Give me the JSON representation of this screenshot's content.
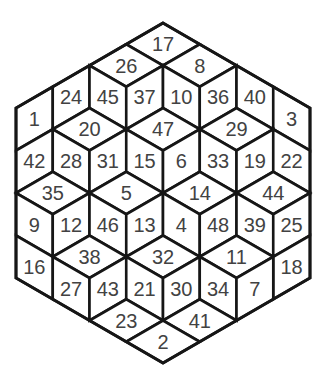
{
  "figure": {
    "kind": "hexagonal-rhombus-number-puzzle",
    "colors": {
      "background": "#ffffff",
      "line": "#161616",
      "number": "#424242"
    },
    "hexagon_side_units": 4,
    "cell_count": 48,
    "cells": [
      {
        "num": 17,
        "shape": "D",
        "m": 0,
        "n": 0
      },
      {
        "num": 26,
        "shape": "D",
        "m": 1,
        "n": 0
      },
      {
        "num": 8,
        "shape": "D",
        "m": 0,
        "n": 1
      },
      {
        "num": 1,
        "shape": "L",
        "m": 3,
        "n": 0
      },
      {
        "num": 24,
        "shape": "L",
        "m": 2,
        "n": 0
      },
      {
        "num": 45,
        "shape": "R",
        "m": 2,
        "n": 0
      },
      {
        "num": 37,
        "shape": "L",
        "m": 1,
        "n": 1
      },
      {
        "num": 10,
        "shape": "R",
        "m": 1,
        "n": 1
      },
      {
        "num": 36,
        "shape": "L",
        "m": 0,
        "n": 2
      },
      {
        "num": 40,
        "shape": "R",
        "m": 0,
        "n": 2
      },
      {
        "num": 3,
        "shape": "R",
        "m": 0,
        "n": 3
      },
      {
        "num": 20,
        "shape": "D",
        "m": 3,
        "n": 1
      },
      {
        "num": 47,
        "shape": "D",
        "m": 2,
        "n": 2
      },
      {
        "num": 29,
        "shape": "D",
        "m": 1,
        "n": 3
      },
      {
        "num": 42,
        "shape": "L",
        "m": 4,
        "n": 1
      },
      {
        "num": 28,
        "shape": "R",
        "m": 4,
        "n": 1
      },
      {
        "num": 31,
        "shape": "L",
        "m": 3,
        "n": 2
      },
      {
        "num": 15,
        "shape": "R",
        "m": 3,
        "n": 2
      },
      {
        "num": 6,
        "shape": "L",
        "m": 2,
        "n": 3
      },
      {
        "num": 33,
        "shape": "R",
        "m": 2,
        "n": 3
      },
      {
        "num": 19,
        "shape": "L",
        "m": 1,
        "n": 4
      },
      {
        "num": 22,
        "shape": "R",
        "m": 1,
        "n": 4
      },
      {
        "num": 35,
        "shape": "D",
        "m": 5,
        "n": 2
      },
      {
        "num": 5,
        "shape": "D",
        "m": 4,
        "n": 3
      },
      {
        "num": 14,
        "shape": "D",
        "m": 3,
        "n": 4
      },
      {
        "num": 44,
        "shape": "D",
        "m": 2,
        "n": 5
      },
      {
        "num": 9,
        "shape": "R",
        "m": 6,
        "n": 2
      },
      {
        "num": 12,
        "shape": "L",
        "m": 5,
        "n": 3
      },
      {
        "num": 46,
        "shape": "R",
        "m": 5,
        "n": 3
      },
      {
        "num": 13,
        "shape": "L",
        "m": 4,
        "n": 4
      },
      {
        "num": 4,
        "shape": "R",
        "m": 4,
        "n": 4
      },
      {
        "num": 48,
        "shape": "L",
        "m": 3,
        "n": 5
      },
      {
        "num": 39,
        "shape": "R",
        "m": 3,
        "n": 5
      },
      {
        "num": 25,
        "shape": "L",
        "m": 2,
        "n": 6
      },
      {
        "num": 16,
        "shape": "R",
        "m": 7,
        "n": 3
      },
      {
        "num": 38,
        "shape": "D",
        "m": 6,
        "n": 4
      },
      {
        "num": 32,
        "shape": "D",
        "m": 5,
        "n": 5
      },
      {
        "num": 11,
        "shape": "D",
        "m": 4,
        "n": 6
      },
      {
        "num": 18,
        "shape": "L",
        "m": 3,
        "n": 7
      },
      {
        "num": 27,
        "shape": "R",
        "m": 7,
        "n": 4
      },
      {
        "num": 43,
        "shape": "L",
        "m": 6,
        "n": 5
      },
      {
        "num": 21,
        "shape": "R",
        "m": 6,
        "n": 5
      },
      {
        "num": 30,
        "shape": "L",
        "m": 5,
        "n": 6
      },
      {
        "num": 34,
        "shape": "R",
        "m": 5,
        "n": 6
      },
      {
        "num": 7,
        "shape": "L",
        "m": 4,
        "n": 7
      },
      {
        "num": 23,
        "shape": "D",
        "m": 7,
        "n": 6
      },
      {
        "num": 41,
        "shape": "D",
        "m": 6,
        "n": 7
      },
      {
        "num": 2,
        "shape": "D",
        "m": 7,
        "n": 7
      }
    ]
  }
}
